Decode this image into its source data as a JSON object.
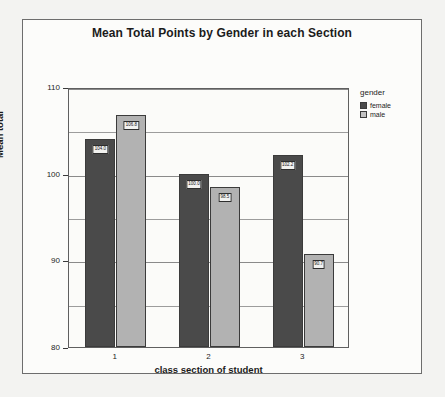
{
  "chart_data": {
    "type": "bar",
    "title": "Mean Total Points by Gender in each Section",
    "xlabel": "class section of student",
    "ylabel": "Mean total",
    "categories": [
      "1",
      "2",
      "3"
    ],
    "ylim": [
      80,
      110
    ],
    "yticks": [
      80,
      90,
      100,
      110
    ],
    "ytick_labels": [
      "80",
      "90",
      "100",
      "110"
    ],
    "minor_gridlines": [
      85,
      95,
      105
    ],
    "grid": true,
    "legend_position": "right",
    "legend_title": "gender",
    "series": [
      {
        "name": "female",
        "color": "#4a4a4a",
        "values": [
          104.0,
          100.0,
          102.2
        ],
        "labels": [
          "104.0",
          "100.0",
          "102.2"
        ]
      },
      {
        "name": "male",
        "color": "#b2b2b2",
        "values": [
          106.8,
          98.5,
          90.7
        ],
        "labels": [
          "106.8",
          "98.5",
          "90.7"
        ]
      }
    ]
  }
}
